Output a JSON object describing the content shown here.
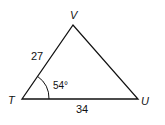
{
  "diagram": {
    "type": "triangle",
    "vertices": {
      "T": {
        "label": "T",
        "x": 22,
        "y": 99
      },
      "V": {
        "label": "V",
        "x": 73,
        "y": 25
      },
      "U": {
        "label": "U",
        "x": 138,
        "y": 99
      }
    },
    "sides": {
      "TV": {
        "label": "27"
      },
      "TU": {
        "label": "34"
      }
    },
    "angles": {
      "T": {
        "label": "54°"
      }
    }
  }
}
